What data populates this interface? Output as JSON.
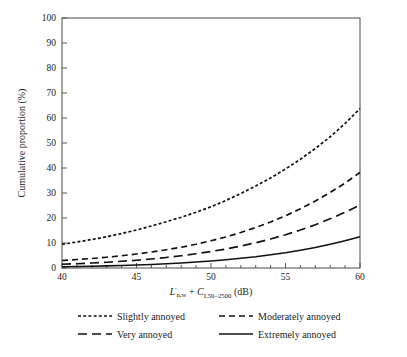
{
  "chart_data": {
    "type": "line",
    "title": "",
    "xlabel": "L'n,w + CI,50-2500 (dB)",
    "xlabel_parts": {
      "symbol1": "L",
      "prime": "'",
      "sub1": "n,w",
      "plus": " + ",
      "symbol2": "C",
      "sub2": "I,50–2500",
      "units": " (dB)"
    },
    "ylabel": "Cumulative proportion (%)",
    "xlim": [
      40,
      60
    ],
    "ylim": [
      0,
      100
    ],
    "xticks": [
      40,
      45,
      50,
      55,
      60
    ],
    "xticklabels": [
      "40",
      "45",
      "50",
      "55",
      "60"
    ],
    "xminortick_step": 1,
    "yticks": [
      0,
      10,
      20,
      30,
      40,
      50,
      60,
      70,
      80,
      90,
      100
    ],
    "yticklabels": [
      "0",
      "10",
      "20",
      "30",
      "40",
      "50",
      "60",
      "70",
      "80",
      "90",
      "100"
    ],
    "grid": false,
    "legend_position": "below",
    "x": [
      40,
      41,
      42,
      43,
      44,
      45,
      46,
      47,
      48,
      49,
      50,
      51,
      52,
      53,
      54,
      55,
      56,
      57,
      58,
      59,
      60
    ],
    "series": [
      {
        "name": "Slightly annoyed",
        "dash": "3,2.2",
        "values": [
          9.5,
          10.4,
          11.4,
          12.5,
          13.8,
          15.2,
          16.8,
          18.5,
          20.3,
          22.3,
          24.5,
          27.0,
          29.8,
          32.8,
          36.0,
          39.6,
          43.5,
          47.8,
          52.5,
          57.8,
          63.8
        ]
      },
      {
        "name": "Moderately annoyed",
        "dash": "6,4",
        "values": [
          3.0,
          3.4,
          3.8,
          4.3,
          4.9,
          5.6,
          6.4,
          7.3,
          8.3,
          9.5,
          10.9,
          12.4,
          14.2,
          16.2,
          18.4,
          20.9,
          23.7,
          26.8,
          30.2,
          34.0,
          38.2
        ]
      },
      {
        "name": "Very annoyed",
        "dash": "9,5",
        "values": [
          1.5,
          1.7,
          2.0,
          2.3,
          2.7,
          3.1,
          3.6,
          4.2,
          4.9,
          5.7,
          6.6,
          7.6,
          8.8,
          10.1,
          11.6,
          13.3,
          15.2,
          17.3,
          19.7,
          22.3,
          25.2
        ]
      },
      {
        "name": "Extremely annoyed",
        "dash": "",
        "values": [
          0.5,
          0.6,
          0.7,
          0.85,
          1.0,
          1.2,
          1.4,
          1.7,
          2.0,
          2.4,
          2.8,
          3.3,
          3.9,
          4.5,
          5.3,
          6.1,
          7.1,
          8.2,
          9.5,
          10.9,
          12.5
        ]
      }
    ],
    "legend": [
      {
        "label": "Slightly annoyed",
        "dash": "3,2.2"
      },
      {
        "label": "Moderately annoyed",
        "dash": "6,4"
      },
      {
        "label": "Very annoyed",
        "dash": "9,5"
      },
      {
        "label": "Extremely annoyed",
        "dash": ""
      }
    ],
    "colors": {
      "line": "#111111",
      "axis": "#4a4a4a",
      "background": "#ffffff"
    }
  }
}
